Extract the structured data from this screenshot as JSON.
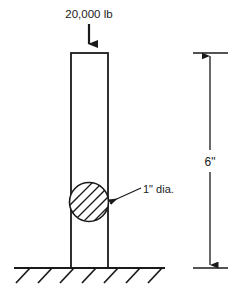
{
  "diagram": {
    "stroke_color": "#1a1a1a",
    "fill_color": "#ffffff",
    "background": "#ffffff",
    "load": {
      "label": "20,000 lb",
      "direction": "down",
      "arrow_name": "load-arrow"
    },
    "column": {
      "name": "column-body",
      "left": 71,
      "right": 108,
      "top": 53,
      "bottom": 268
    },
    "hole": {
      "label": "1\" dia.",
      "center_x": 89,
      "center_y": 202,
      "radius": 20,
      "hatched": true
    },
    "height_dimension": {
      "label": "6\"",
      "line_x": 210,
      "top": 53,
      "bottom": 268
    },
    "ground": {
      "name": "ground-line",
      "left": 14,
      "right": 165,
      "y": 268,
      "hatch_count": 7
    }
  }
}
